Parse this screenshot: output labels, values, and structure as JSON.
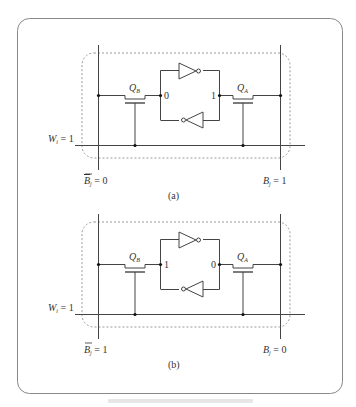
{
  "figure": {
    "border_color": "#888888",
    "wire_color": "#444444",
    "dash_color": "#999999",
    "panels": [
      {
        "id": "a",
        "label": "(a)",
        "word_line": {
          "name": "W",
          "sub": "i",
          "value": "1"
        },
        "bit_line_bar": {
          "name": "B",
          "sub": "j",
          "value": "0",
          "overline": true
        },
        "bit_line": {
          "name": "B",
          "sub": "j",
          "value": "1"
        },
        "transistor_left": {
          "name": "Q",
          "sub": "B"
        },
        "transistor_right": {
          "name": "Q",
          "sub": "A"
        },
        "node_left_value": "0",
        "node_right_value": "1"
      },
      {
        "id": "b",
        "label": "(b)",
        "word_line": {
          "name": "W",
          "sub": "i",
          "value": "1"
        },
        "bit_line_bar": {
          "name": "B",
          "sub": "j",
          "value": "1",
          "overline": true
        },
        "bit_line": {
          "name": "B",
          "sub": "j",
          "value": "0"
        },
        "transistor_left": {
          "name": "Q",
          "sub": "B"
        },
        "transistor_right": {
          "name": "Q",
          "sub": "A"
        },
        "node_left_value": "1",
        "node_right_value": "0"
      }
    ]
  }
}
